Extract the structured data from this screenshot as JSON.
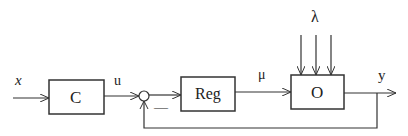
{
  "diagram": {
    "type": "block-diagram",
    "blocks": [
      {
        "id": "C",
        "label": "C"
      },
      {
        "id": "Reg",
        "label": "Reg"
      },
      {
        "id": "O",
        "label": "O"
      }
    ],
    "signals": {
      "input": "x",
      "after_C": "u",
      "control": "μ",
      "disturbance": "λ",
      "output": "y",
      "feedback_sign": "—"
    },
    "summing_junction": {
      "inputs": [
        "u",
        "-y"
      ],
      "output": "Reg"
    },
    "edges": [
      {
        "from": "x",
        "to": "C"
      },
      {
        "from": "C",
        "to": "sum",
        "label": "u"
      },
      {
        "from": "sum",
        "to": "Reg"
      },
      {
        "from": "Reg",
        "to": "O",
        "label": "μ"
      },
      {
        "from": "λ",
        "to": "O",
        "count": 3
      },
      {
        "from": "O",
        "to": "y",
        "label": "y"
      },
      {
        "from": "y",
        "to": "sum",
        "sign": "-"
      }
    ],
    "colors": {
      "stroke": "#333333",
      "background": "#ffffff"
    }
  }
}
